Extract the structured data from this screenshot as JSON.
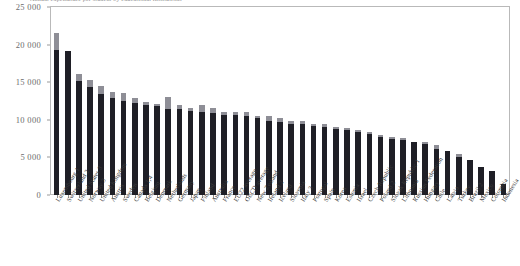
{
  "chart_data": {
    "type": "bar",
    "title": "Annual expenditure per student by educational institutions",
    "subtitle": "",
    "xlabel": "",
    "ylabel": "",
    "ylim": [
      0,
      25000
    ],
    "ytick_labels": [
      "25 000",
      "20 000",
      "15 000",
      "10 000",
      "5 000",
      "0"
    ],
    "ytick_values": [
      25000,
      20000,
      15000,
      10000,
      5000,
      0
    ],
    "grid": false,
    "legend_position": "none",
    "stacked": true,
    "categories": [
      "Luxembourg 1",
      "Switzerland 2",
      "United States 3",
      "Norway 3",
      "United Kingdom",
      "Austria",
      "Sweden",
      "Canada 1,4",
      "Belgium",
      "Denmark",
      "Netherlands",
      "Germany",
      "Japan",
      "Finland",
      "Australia",
      "France",
      "EU22 average",
      "OECD average",
      "New Zealand",
      "Ireland 2",
      "Iceland",
      "Slovenia",
      "Italy 3",
      "Portugal",
      "Spain",
      "Korea",
      "Estonia",
      "Israel",
      "Czech Republic",
      "Poland 2",
      "Slovak Republic 1",
      "Lithuania",
      "Russian Federation",
      "Hungary",
      "Chile",
      "Latvia",
      "Turkey",
      "Brazil 2",
      "Mexico",
      "Colombia",
      "Indonesia"
    ],
    "series": [
      {
        "name": "Primary to tertiary (base)",
        "color": "#1f1f26",
        "values": [
          19300,
          19100,
          15200,
          14400,
          13400,
          12900,
          12500,
          12200,
          12000,
          11900,
          11500,
          11400,
          11200,
          11100,
          10900,
          10700,
          10600,
          10500,
          10200,
          9900,
          9700,
          9500,
          9400,
          9200,
          9000,
          8800,
          8600,
          8400,
          8100,
          7700,
          7500,
          7300,
          7100,
          6800,
          6100,
          5900,
          5000,
          4700,
          3700,
          3200,
          1500
        ]
      },
      {
        "name": "R&D and ancillary services (top)",
        "color": "#8e8e96",
        "values": [
          2200,
          0,
          900,
          900,
          1100,
          800,
          1100,
          700,
          400,
          200,
          1600,
          600,
          400,
          900,
          700,
          400,
          500,
          500,
          300,
          600,
          500,
          300,
          400,
          200,
          400,
          300,
          300,
          200,
          300,
          300,
          200,
          300,
          0,
          200,
          600,
          0,
          500,
          0,
          0,
          0,
          0
        ]
      }
    ]
  }
}
